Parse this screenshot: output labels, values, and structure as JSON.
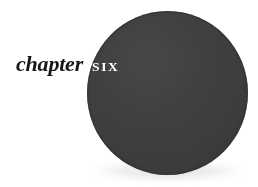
{
  "page": {
    "kind": "book-chapter-opener",
    "background_color": "#ffffff",
    "width": 258,
    "height": 187
  },
  "heading": {
    "label": "chapter",
    "number_word": "six",
    "label_color": "#17171a",
    "number_color": "#ffffff"
  },
  "ornament": {
    "shape_name": "filled-circle",
    "fill_color": "#3d3d3d",
    "center_x": 167,
    "center_y": 93,
    "radius": 81
  }
}
